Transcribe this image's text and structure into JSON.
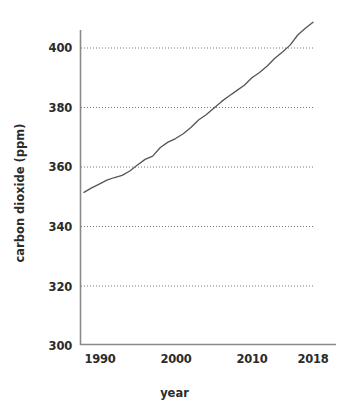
{
  "chart_data": {
    "type": "line",
    "title": "",
    "xlabel": "year",
    "ylabel": "carbon dioxide (ppm)",
    "xlim": [
      1988,
      2018
    ],
    "ylim": [
      300,
      408
    ],
    "xticks": [
      "1990",
      "2000",
      "2010",
      "2018"
    ],
    "yticks": [
      "300",
      "320",
      "340",
      "360",
      "380",
      "400"
    ],
    "grid": "horizontal-dotted",
    "legend": "none",
    "line_color": "#555555",
    "series": [
      {
        "name": "carbon dioxide",
        "x": [
          1988,
          1989,
          1990,
          1991,
          1992,
          1993,
          1994,
          1995,
          1996,
          1997,
          1998,
          1999,
          2000,
          2001,
          2002,
          2003,
          2004,
          2005,
          2006,
          2007,
          2008,
          2009,
          2010,
          2011,
          2012,
          2013,
          2014,
          2015,
          2016,
          2017,
          2018
        ],
        "values": [
          351.3,
          352.8,
          354.1,
          355.4,
          356.3,
          357.0,
          358.5,
          360.5,
          362.4,
          363.5,
          366.4,
          368.2,
          369.4,
          371.0,
          373.1,
          375.6,
          377.4,
          379.6,
          381.8,
          383.7,
          385.5,
          387.3,
          389.8,
          391.6,
          393.8,
          396.4,
          398.5,
          400.8,
          404.2,
          406.5,
          408.5
        ]
      }
    ]
  },
  "axes": {
    "y_ticks": [
      {
        "label": "400",
        "value": 400
      },
      {
        "label": "380",
        "value": 380
      },
      {
        "label": "360",
        "value": 360
      },
      {
        "label": "340",
        "value": 340
      },
      {
        "label": "320",
        "value": 320
      },
      {
        "label": "300",
        "value": 300
      }
    ],
    "x_ticks": [
      {
        "label": "1990",
        "value": 1990
      },
      {
        "label": "2000",
        "value": 2000
      },
      {
        "label": "2010",
        "value": 2010
      },
      {
        "label": "2018",
        "value": 2018
      }
    ],
    "x_axis_title": "year",
    "y_axis_title": "carbon dioxide (ppm)"
  }
}
